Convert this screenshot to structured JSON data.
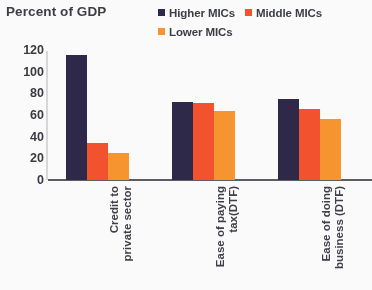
{
  "chart_data": {
    "type": "bar",
    "title": "Percent of GDP",
    "xlabel": "",
    "ylabel": "",
    "ylim": [
      0,
      120
    ],
    "yticks": [
      120,
      100,
      80,
      60,
      40,
      20,
      0
    ],
    "grid": false,
    "legend_position": "top-right",
    "categories": [
      "Credit to private sector",
      "Ease of paying tax(DTF)",
      "Ease  of doing business (DTF)"
    ],
    "category_lines": [
      [
        "Credit  to",
        "private sector"
      ],
      [
        "Ease  of  paying",
        "tax(DTF)"
      ],
      [
        "Ease   of  doing",
        "business (DTF)"
      ]
    ],
    "series": [
      {
        "name": "Higher MICs",
        "color": "#2b2546",
        "values": [
          115,
          72,
          75
        ]
      },
      {
        "name": "Middle MICs",
        "color": "#f4502a",
        "values": [
          34,
          71,
          66
        ]
      },
      {
        "name": "Lower MICs",
        "color": "#f8942c",
        "values": [
          25,
          64,
          56
        ]
      }
    ]
  }
}
